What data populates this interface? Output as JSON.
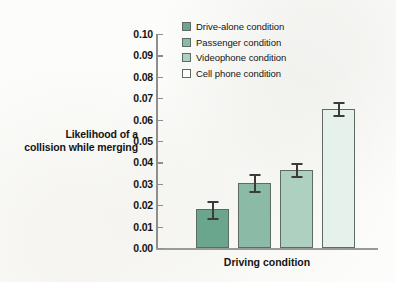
{
  "chart_data": {
    "type": "bar",
    "title": "",
    "xlabel": "Driving condition",
    "ylabel": "Likelihood of a collision while merging",
    "ylabel_line1": "Likelihood of a",
    "ylabel_line2": "collision while merging",
    "ylim": [
      0,
      0.1
    ],
    "ytick_labels": [
      "0.10",
      "0.09",
      "0.08",
      "0.07",
      "0.06",
      "0.05",
      "0.04",
      "0.03",
      "0.02",
      "0.01",
      "0.00"
    ],
    "ytick_values": [
      0.1,
      0.09,
      0.08,
      0.07,
      0.06,
      0.05,
      0.04,
      0.03,
      0.02,
      0.01,
      0.0
    ],
    "grid": false,
    "legend_position": "top-right-inside",
    "categories": [
      "Drive-alone condition",
      "Passenger condition",
      "Videophone condition",
      "Cell phone condition"
    ],
    "values": [
      0.018,
      0.0305,
      0.0365,
      0.065
    ],
    "errors": [
      0.004,
      0.004,
      0.003,
      0.003
    ],
    "colors": [
      "#6aa68d",
      "#8bbba6",
      "#aed0c1",
      "#e6f1ec"
    ],
    "bar_edge_color": "#5d6b62",
    "error_bar_color": "#3b3b3b",
    "axis_color": "#8e8e8e",
    "bars": [
      {
        "label": "Drive-alone condition",
        "value": 0.018,
        "error": 0.004,
        "color": "#6aa68d"
      },
      {
        "label": "Passenger condition",
        "value": 0.0305,
        "error": 0.004,
        "color": "#8bbba6"
      },
      {
        "label": "Videophone condition",
        "value": 0.0365,
        "error": 0.003,
        "color": "#aed0c1"
      },
      {
        "label": "Cell phone condition",
        "value": 0.065,
        "error": 0.003,
        "color": "#e6f1ec"
      }
    ],
    "legend": [
      {
        "label": "Drive-alone condition",
        "color": "#6aa68d"
      },
      {
        "label": "Passenger condition",
        "color": "#8bbba6"
      },
      {
        "label": "Videophone condition",
        "color": "#aed0c1"
      },
      {
        "label": "Cell phone condition",
        "color": "#ffffff"
      }
    ]
  }
}
